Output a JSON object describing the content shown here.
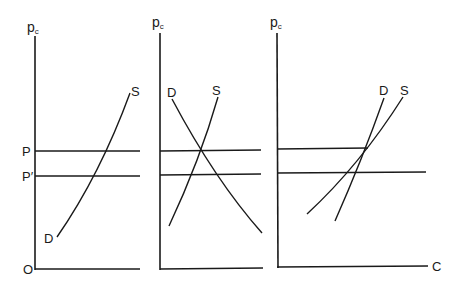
{
  "diagram": {
    "type": "supply-demand-panels",
    "panels": [
      {
        "id": "left",
        "y_axis_label": "p",
        "y_axis_subscript": "c",
        "origin_label": "O",
        "price_lines": [
          {
            "label": "P"
          },
          {
            "label": "P′"
          }
        ],
        "curves": [
          {
            "label": "S"
          },
          {
            "label": "D"
          }
        ]
      },
      {
        "id": "middle",
        "y_axis_label": "p",
        "y_axis_subscript": "c",
        "curves": [
          {
            "label": "D"
          },
          {
            "label": "S"
          }
        ]
      },
      {
        "id": "right",
        "y_axis_label": "p",
        "y_axis_subscript": "c",
        "x_axis_label": "C",
        "curves": [
          {
            "label": "D"
          },
          {
            "label": "S"
          }
        ]
      }
    ]
  }
}
